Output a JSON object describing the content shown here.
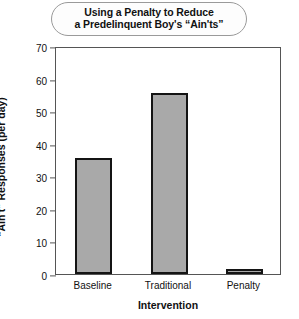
{
  "chart_data": {
    "type": "bar",
    "title": "Using a Penalty to Reduce a Predelinquent Boy's “Ain'ts”",
    "title_lines": [
      "Using a Penalty to Reduce",
      "a Predelinquent Boy's “Ain'ts”"
    ],
    "categories": [
      "Baseline",
      "Traditional",
      "Penalty"
    ],
    "values": [
      35.5,
      55.5,
      1.5
    ],
    "xlabel": "Intervention",
    "ylabel": "“Ain't” Responses (per day)",
    "ylim": [
      0,
      70
    ],
    "ytick_step": 10,
    "yticks": [
      "0",
      "10",
      "20",
      "30",
      "40",
      "50",
      "60",
      "70"
    ],
    "grid": false,
    "legend": "none",
    "bar_fill_color": "#a9a9a9",
    "bar_edge_color": "#141414",
    "frame_color": "#555555"
  }
}
